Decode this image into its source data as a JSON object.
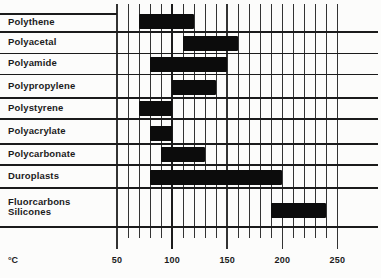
{
  "chart_data": {
    "type": "bar",
    "orientation": "horizontal-range",
    "title": "",
    "unit_label": "°C",
    "axis": {
      "xlabel": "°C",
      "ticks": [
        50,
        100,
        150,
        200,
        250
      ],
      "minor_step": 10,
      "xlim": [
        50,
        250
      ],
      "emphasized_gridline": 100,
      "grid": true,
      "legend": "none"
    },
    "rows": [
      {
        "label": [
          "Polythene"
        ],
        "range_c": [
          70,
          120
        ]
      },
      {
        "label": [
          "Polyacetal"
        ],
        "range_c": [
          110,
          160
        ]
      },
      {
        "label": [
          "Polyamide"
        ],
        "range_c": [
          80,
          150
        ]
      },
      {
        "label": [
          "Polypropylene"
        ],
        "range_c": [
          100,
          140
        ]
      },
      {
        "label": [
          "Polystyrene"
        ],
        "range_c": [
          70,
          100
        ]
      },
      {
        "label": [
          "Polyacrylate"
        ],
        "range_c": [
          80,
          100
        ]
      },
      {
        "label": [
          "Polycarbonate"
        ],
        "range_c": [
          90,
          130
        ]
      },
      {
        "label": [
          "Duroplasts"
        ],
        "range_c": [
          80,
          200
        ]
      },
      {
        "label": [
          "Fluorcarbons",
          "Silicones"
        ],
        "range_c": [
          190,
          240
        ]
      }
    ],
    "colors": {
      "background": "#fcfcfb",
      "grid_ink": "#333333",
      "text_ink": "#1b1b1b",
      "bar": "#0c0c0c"
    }
  }
}
